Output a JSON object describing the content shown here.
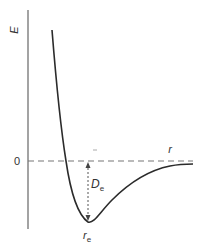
{
  "diagram": {
    "y_axis_label": "E",
    "x_axis_label": "r",
    "zero_label": "0",
    "well_depth_label": {
      "main": "D",
      "sub": "e"
    },
    "equilibrium_label": {
      "main": "r",
      "sub": "e"
    },
    "colors": {
      "curve": "#2b2b2b",
      "axis": "#555555",
      "dashed": "#666666",
      "text": "#333333"
    }
  }
}
